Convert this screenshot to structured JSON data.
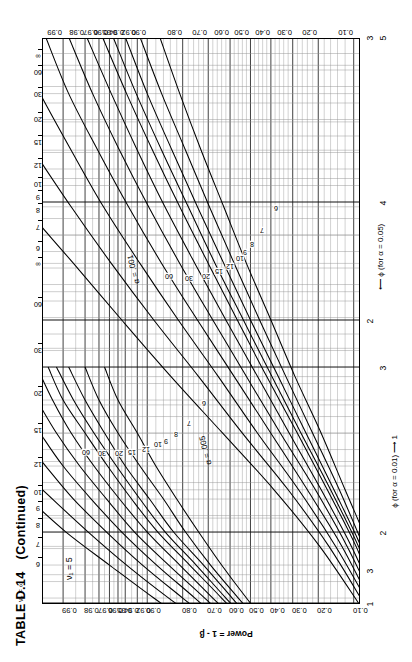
{
  "page": {
    "table_label": "TABLE D.14",
    "continued": "(Continued)"
  },
  "axes": {
    "y_title": "Power = 1 - β",
    "y_ticks": [
      "0.99",
      "0.98",
      "0.97",
      "0.96",
      "0.95",
      "0.94",
      "0.92",
      "0.90",
      "0.80",
      "0.70",
      "0.60",
      "0.50",
      "0.40",
      "0.30",
      "0.20",
      "0.10"
    ],
    "x_title_alpha01": "ϕ (for α = 0.01)",
    "x_arrow_alpha01": "⟶",
    "x_start_alpha01": "1",
    "x_ticks_alpha01": [
      "1",
      "2",
      "3"
    ],
    "x_title_alpha05": "ϕ (for α = 0.05)",
    "x_arrow_alpha05": "⟵",
    "x_start_alpha05": "3",
    "x_ticks_alpha05": [
      "2",
      "3",
      "4",
      "5"
    ]
  },
  "annotations": {
    "nu1": "ν₁ = 5",
    "nu2_axis": "ν₂ = ∞",
    "alpha_005": "α = .005",
    "alpha_001": "α = .001"
  },
  "chart_data": {
    "type": "line",
    "subtitle": "Pearson–Hartley power curves for the analysis of variance, ν₁ = 5",
    "xlabel": "ϕ (for α = 0.01)  /  ϕ (for α = 0.05)",
    "ylabel": "Power = 1 - β",
    "grid": true,
    "legend": "inline curve labels (ν₂)",
    "ylim": [
      0.1,
      0.995
    ],
    "y_tick_values": [
      0.99,
      0.98,
      0.97,
      0.96,
      0.95,
      0.94,
      0.92,
      0.9,
      0.8,
      0.7,
      0.6,
      0.5,
      0.4,
      0.3,
      0.2,
      0.1
    ],
    "x_axis_alpha01": {
      "label": "ϕ (for α = 0.01)",
      "ticks": [
        1,
        2,
        3
      ],
      "range": [
        1,
        3
      ]
    },
    "x_axis_alpha05": {
      "label": "ϕ (for α = 0.05)",
      "ticks": [
        2,
        3,
        4,
        5
      ],
      "range": [
        1.6,
        5
      ]
    },
    "nu2_levels": [
      "6",
      "7",
      "8",
      "9",
      "10",
      "12",
      "15",
      "20",
      "30",
      "60",
      "∞"
    ],
    "series_alpha05": [
      {
        "name": "ν₂ = 6",
        "alpha": 0.05,
        "x": [
          1.0,
          1.2,
          1.4,
          1.6,
          1.8,
          2.0,
          2.2,
          2.4,
          2.6,
          2.8,
          3.0
        ],
        "y": [
          0.18,
          0.27,
          0.39,
          0.52,
          0.64,
          0.74,
          0.82,
          0.88,
          0.92,
          0.95,
          0.965
        ]
      },
      {
        "name": "ν₂ = 7",
        "alpha": 0.05,
        "x": [
          1.0,
          1.2,
          1.4,
          1.6,
          1.8,
          2.0,
          2.2,
          2.4,
          2.6,
          2.8,
          3.0
        ],
        "y": [
          0.19,
          0.29,
          0.42,
          0.56,
          0.69,
          0.79,
          0.86,
          0.915,
          0.95,
          0.97,
          0.98
        ]
      },
      {
        "name": "ν₂ = 8",
        "alpha": 0.05,
        "x": [
          1.0,
          1.2,
          1.4,
          1.6,
          1.8,
          2.0,
          2.2,
          2.4,
          2.6,
          2.8,
          3.0
        ],
        "y": [
          0.2,
          0.31,
          0.45,
          0.59,
          0.72,
          0.83,
          0.895,
          0.94,
          0.965,
          0.98,
          0.988
        ]
      },
      {
        "name": "ν₂ = 9",
        "alpha": 0.05,
        "x": [
          1.0,
          1.2,
          1.4,
          1.6,
          1.8,
          2.0,
          2.2,
          2.4,
          2.6,
          2.8,
          3.0
        ],
        "y": [
          0.21,
          0.32,
          0.47,
          0.62,
          0.75,
          0.855,
          0.915,
          0.952,
          0.974,
          0.986,
          0.992
        ]
      },
      {
        "name": "ν₂ = 10",
        "alpha": 0.05,
        "x": [
          1.0,
          1.2,
          1.4,
          1.6,
          1.8,
          2.0,
          2.2,
          2.4,
          2.6,
          2.8,
          3.0
        ],
        "y": [
          0.215,
          0.335,
          0.49,
          0.64,
          0.775,
          0.875,
          0.93,
          0.962,
          0.98,
          0.99,
          0.994
        ]
      },
      {
        "name": "ν₂ = 12",
        "alpha": 0.05,
        "x": [
          1.0,
          1.2,
          1.4,
          1.6,
          1.8,
          2.0,
          2.2,
          2.4,
          2.6,
          2.8,
          3.0
        ],
        "y": [
          0.225,
          0.355,
          0.52,
          0.68,
          0.81,
          0.9,
          0.948,
          0.974,
          0.987,
          0.993,
          0.996
        ]
      },
      {
        "name": "ν₂ = 15",
        "alpha": 0.05,
        "x": [
          1.0,
          1.2,
          1.4,
          1.6,
          1.8,
          2.0,
          2.2,
          2.4,
          2.6,
          2.8,
          3.0
        ],
        "y": [
          0.235,
          0.38,
          0.55,
          0.715,
          0.845,
          0.925,
          0.963,
          0.983,
          0.992,
          0.996,
          0.998
        ]
      },
      {
        "name": "ν₂ = 20",
        "alpha": 0.05,
        "x": [
          1.0,
          1.2,
          1.4,
          1.6,
          1.8,
          2.0,
          2.2,
          2.4,
          2.6,
          2.8,
          3.0
        ],
        "y": [
          0.25,
          0.405,
          0.59,
          0.755,
          0.878,
          0.945,
          0.976,
          0.99,
          0.9955,
          0.998,
          0.999
        ]
      },
      {
        "name": "ν₂ = 30",
        "alpha": 0.05,
        "x": [
          1.0,
          1.2,
          1.4,
          1.6,
          1.8,
          2.0,
          2.2,
          2.4,
          2.6,
          2.8,
          3.0
        ],
        "y": [
          0.265,
          0.435,
          0.63,
          0.8,
          0.91,
          0.963,
          0.986,
          0.9945,
          0.998,
          0.9992,
          0.9996
        ]
      },
      {
        "name": "ν₂ = 60",
        "alpha": 0.05,
        "x": [
          1.0,
          1.2,
          1.4,
          1.6,
          1.8,
          2.0,
          2.2,
          2.4,
          2.6,
          2.8,
          3.0
        ],
        "y": [
          0.285,
          0.47,
          0.675,
          0.845,
          0.938,
          0.978,
          0.993,
          0.998,
          0.9992,
          0.9997,
          0.9999
        ]
      },
      {
        "name": "ν₂ = ∞",
        "alpha": 0.05,
        "x": [
          1.0,
          1.2,
          1.4,
          1.6,
          1.8,
          2.0,
          2.2,
          2.4,
          2.6,
          2.8,
          3.0
        ],
        "y": [
          0.31,
          0.515,
          0.73,
          0.885,
          0.96,
          0.989,
          0.997,
          0.9993,
          0.99985,
          0.99997,
          0.99999
        ]
      }
    ],
    "series_alpha01": [
      {
        "name": "ν₂ = 6",
        "alpha": 0.01,
        "x": [
          1.0,
          1.2,
          1.4,
          1.6,
          1.8,
          2.0,
          2.2,
          2.4,
          2.6,
          2.8,
          3.0
        ],
        "y": [
          0.04,
          0.07,
          0.12,
          0.19,
          0.29,
          0.4,
          0.52,
          0.63,
          0.73,
          0.81,
          0.87
        ]
      },
      {
        "name": "ν₂ = 7",
        "alpha": 0.01,
        "x": [
          1.0,
          1.2,
          1.4,
          1.6,
          1.8,
          2.0,
          2.2,
          2.4,
          2.6,
          2.8,
          3.0
        ],
        "y": [
          0.045,
          0.08,
          0.135,
          0.22,
          0.33,
          0.455,
          0.58,
          0.695,
          0.79,
          0.865,
          0.915
        ]
      },
      {
        "name": "ν₂ = 8",
        "alpha": 0.01,
        "x": [
          1.0,
          1.2,
          1.4,
          1.6,
          1.8,
          2.0,
          2.2,
          2.4,
          2.6,
          2.8,
          3.0
        ],
        "y": [
          0.05,
          0.085,
          0.15,
          0.245,
          0.365,
          0.5,
          0.63,
          0.745,
          0.835,
          0.9,
          0.94
        ]
      },
      {
        "name": "ν₂ = 9",
        "alpha": 0.01,
        "x": [
          1.0,
          1.2,
          1.4,
          1.6,
          1.8,
          2.0,
          2.2,
          2.4,
          2.6,
          2.8,
          3.0
        ],
        "y": [
          0.052,
          0.09,
          0.16,
          0.265,
          0.395,
          0.535,
          0.67,
          0.78,
          0.865,
          0.922,
          0.956
        ]
      },
      {
        "name": "ν₂ = 10",
        "alpha": 0.01,
        "x": [
          1.0,
          1.2,
          1.4,
          1.6,
          1.8,
          2.0,
          2.2,
          2.4,
          2.6,
          2.8,
          3.0
        ],
        "y": [
          0.055,
          0.095,
          0.17,
          0.28,
          0.42,
          0.565,
          0.7,
          0.81,
          0.888,
          0.938,
          0.967
        ]
      },
      {
        "name": "ν₂ = 12",
        "alpha": 0.01,
        "x": [
          1.0,
          1.2,
          1.4,
          1.6,
          1.8,
          2.0,
          2.2,
          2.4,
          2.6,
          2.8,
          3.0
        ],
        "y": [
          0.058,
          0.105,
          0.19,
          0.315,
          0.465,
          0.62,
          0.755,
          0.856,
          0.92,
          0.958,
          0.979
        ]
      },
      {
        "name": "ν₂ = 15",
        "alpha": 0.01,
        "x": [
          1.0,
          1.2,
          1.4,
          1.6,
          1.8,
          2.0,
          2.2,
          2.4,
          2.6,
          2.8,
          3.0
        ],
        "y": [
          0.062,
          0.115,
          0.21,
          0.355,
          0.52,
          0.68,
          0.81,
          0.897,
          0.948,
          0.975,
          0.988
        ]
      },
      {
        "name": "ν₂ = 20",
        "alpha": 0.01,
        "x": [
          1.0,
          1.2,
          1.4,
          1.6,
          1.8,
          2.0,
          2.2,
          2.4,
          2.6,
          2.8,
          3.0
        ],
        "y": [
          0.067,
          0.128,
          0.24,
          0.4,
          0.58,
          0.745,
          0.865,
          0.935,
          0.971,
          0.988,
          0.9945
        ]
      },
      {
        "name": "ν₂ = 30",
        "alpha": 0.01,
        "x": [
          1.0,
          1.2,
          1.4,
          1.6,
          1.8,
          2.0,
          2.2,
          2.4,
          2.6,
          2.8,
          3.0
        ],
        "y": [
          0.072,
          0.145,
          0.275,
          0.465,
          0.655,
          0.815,
          0.915,
          0.966,
          0.987,
          0.9955,
          0.9985
        ]
      },
      {
        "name": "ν₂ = 60",
        "alpha": 0.01,
        "x": [
          1.0,
          1.2,
          1.4,
          1.6,
          1.8,
          2.0,
          2.2,
          2.4,
          2.6,
          2.8,
          3.0
        ],
        "y": [
          0.08,
          0.165,
          0.32,
          0.54,
          0.74,
          0.885,
          0.958,
          0.987,
          0.9965,
          0.9992,
          0.9998
        ]
      },
      {
        "name": "ν₂ = ∞",
        "alpha": 0.01,
        "x": [
          1.0,
          1.2,
          1.4,
          1.6,
          1.8,
          2.0,
          2.2,
          2.4,
          2.6,
          2.8,
          3.0
        ],
        "y": [
          0.09,
          0.195,
          0.385,
          0.635,
          0.838,
          0.945,
          0.986,
          0.9975,
          0.99965,
          0.99996,
          0.999995
        ]
      }
    ]
  }
}
